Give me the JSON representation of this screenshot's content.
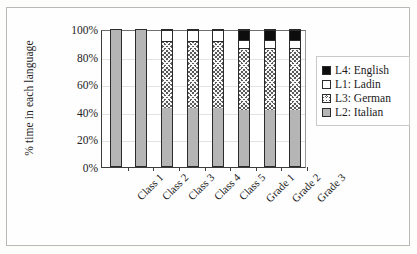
{
  "chart_data": {
    "type": "bar",
    "subtype": "stacked-bar-100",
    "title": "",
    "xlabel": "",
    "ylabel": "% time in each language",
    "ylim": [
      0,
      100
    ],
    "yticks": [
      "0%",
      "20%",
      "40%",
      "60%",
      "80%",
      "100%"
    ],
    "ytick_values": [
      0,
      20,
      40,
      60,
      80,
      100
    ],
    "grid": true,
    "grid_axis": "y",
    "legend_position": "right",
    "categories": [
      "Class 1",
      "Class 2",
      "Class 3",
      "Class 4",
      "Class 5",
      "Grade 1",
      "Grade 2",
      "Grade 3"
    ],
    "stack_order_bottom_to_top": [
      "L2: Italian",
      "L3: German",
      "L1: Ladin",
      "L4: English"
    ],
    "series": [
      {
        "name": "L2: Italian",
        "key": "italian",
        "color": "#b5b5b5",
        "pattern": "solid-gray",
        "values": [
          100,
          100,
          43,
          43,
          43,
          41,
          41,
          41
        ]
      },
      {
        "name": "L3: German",
        "key": "german",
        "color": "#5a5a5a",
        "pattern": "cross-hatch",
        "values": [
          0,
          0,
          49,
          49,
          49,
          46,
          46,
          46
        ]
      },
      {
        "name": "L1: Ladin",
        "key": "ladin",
        "color": "#ffffff",
        "pattern": "solid-white",
        "values": [
          0,
          0,
          8,
          8,
          8,
          6,
          6,
          6
        ]
      },
      {
        "name": "L4: English",
        "key": "english",
        "color": "#0d0d0d",
        "pattern": "solid-black",
        "values": [
          0,
          0,
          0,
          0,
          0,
          7,
          7,
          7
        ]
      }
    ],
    "legend_entries": [
      {
        "label": "L4: English",
        "key": "english"
      },
      {
        "label": "L1: Ladin",
        "key": "ladin"
      },
      {
        "label": "L3: German",
        "key": "german"
      },
      {
        "label": "L2: Italian",
        "key": "italian"
      }
    ]
  }
}
